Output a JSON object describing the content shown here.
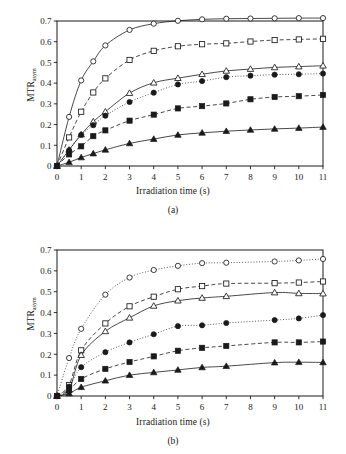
{
  "figure": {
    "background": "#ffffff",
    "ink": "#1a1a1a"
  },
  "panels": [
    {
      "id": "a",
      "caption": "(a)",
      "xlabel": "Irradiation time (s)",
      "ylabel_main": "MTR",
      "ylabel_sub": "asym"
    },
    {
      "id": "b",
      "caption": "(b)",
      "xlabel": "Irradiation time (s)",
      "ylabel_main": "MTR",
      "ylabel_sub": "asym"
    }
  ],
  "chart_data": [
    {
      "type": "scatter",
      "panel": "(a)",
      "title": "",
      "xlabel": "Irradiation time (s)",
      "ylabel": "MTR_asym",
      "xlim": [
        0,
        11
      ],
      "ylim": [
        0,
        0.7
      ],
      "xticks": [
        0,
        1,
        2,
        3,
        4,
        5,
        6,
        7,
        8,
        9,
        10,
        11
      ],
      "xticklabels": [
        "0",
        "1",
        "2",
        "3",
        "4",
        "5",
        "6",
        "7",
        "8",
        "9",
        "10",
        "11"
      ],
      "yticks": [
        0,
        0.1,
        0.2,
        0.3,
        0.4,
        0.5,
        0.6,
        0.7
      ],
      "yticklabels": [
        "0",
        "0.1",
        "0.2",
        "0.3",
        "0.4",
        "0.5",
        "0.6",
        "0.7"
      ],
      "grid": false,
      "legend": "none",
      "x": [
        0,
        0.5,
        1,
        1.5,
        2,
        3,
        4,
        5,
        6,
        7,
        8,
        9,
        10,
        11
      ],
      "series": [
        {
          "name": "open-circle",
          "marker": "circle-open",
          "line": "solid",
          "values": [
            0.0,
            0.237,
            0.413,
            0.505,
            0.582,
            0.657,
            0.687,
            0.701,
            0.708,
            0.711,
            0.712,
            0.713,
            0.714,
            0.714
          ]
        },
        {
          "name": "open-square",
          "marker": "square-open",
          "line": "dashed",
          "values": [
            0.0,
            0.138,
            0.262,
            0.355,
            0.423,
            0.512,
            0.556,
            0.578,
            0.588,
            0.592,
            0.601,
            0.608,
            0.611,
            0.614
          ]
        },
        {
          "name": "open-triangle",
          "marker": "triangle-open",
          "line": "solid",
          "values": [
            0.0,
            0.078,
            0.152,
            0.214,
            0.262,
            0.352,
            0.402,
            0.424,
            0.443,
            0.459,
            0.468,
            0.476,
            0.48,
            0.484
          ]
        },
        {
          "name": "filled-circle",
          "marker": "circle-filled",
          "line": "dotted",
          "values": [
            0.0,
            0.076,
            0.15,
            0.197,
            0.243,
            0.309,
            0.354,
            0.394,
            0.41,
            0.429,
            0.436,
            0.441,
            0.443,
            0.446
          ]
        },
        {
          "name": "filled-square",
          "marker": "square-filled",
          "line": "dashed",
          "values": [
            0.0,
            0.056,
            0.095,
            0.144,
            0.172,
            0.219,
            0.248,
            0.278,
            0.289,
            0.302,
            0.322,
            0.333,
            0.337,
            0.343
          ]
        },
        {
          "name": "filled-triangle",
          "marker": "triangle-filled",
          "line": "solid",
          "values": [
            0.0,
            0.018,
            0.041,
            0.06,
            0.078,
            0.109,
            0.13,
            0.15,
            0.16,
            0.168,
            0.174,
            0.179,
            0.183,
            0.188
          ]
        }
      ]
    },
    {
      "type": "scatter",
      "panel": "(b)",
      "title": "",
      "xlabel": "Irradiation time (s)",
      "ylabel": "MTR_asym",
      "xlim": [
        0,
        11
      ],
      "ylim": [
        0,
        0.7
      ],
      "xticks": [
        0,
        1,
        2,
        3,
        4,
        5,
        6,
        7,
        8,
        9,
        10,
        11
      ],
      "xticklabels": [
        "0",
        "1",
        "2",
        "3",
        "4",
        "5",
        "6",
        "7",
        "8",
        "9",
        "10",
        "11"
      ],
      "yticks": [
        0,
        0.1,
        0.2,
        0.3,
        0.4,
        0.5,
        0.6,
        0.7
      ],
      "yticklabels": [
        "0",
        "0.1",
        "0.2",
        "0.3",
        "0.4",
        "0.5",
        "0.6",
        "0.7"
      ],
      "grid": false,
      "legend": "none",
      "x": [
        0,
        0.5,
        1,
        2,
        3,
        4,
        5,
        6,
        7,
        9,
        10,
        11
      ],
      "series": [
        {
          "name": "open-circle",
          "marker": "circle-open",
          "line": "dotted",
          "values": [
            0.0,
            0.182,
            0.322,
            0.486,
            0.568,
            0.604,
            0.624,
            0.637,
            0.639,
            0.645,
            0.65,
            0.657
          ]
        },
        {
          "name": "open-square",
          "marker": "square-open",
          "line": "dashed",
          "values": [
            0.0,
            0.052,
            0.219,
            0.348,
            0.43,
            0.476,
            0.512,
            0.527,
            0.539,
            0.541,
            0.544,
            0.549
          ]
        },
        {
          "name": "open-triangle",
          "marker": "triangle-open",
          "line": "solid",
          "values": [
            0.0,
            0.03,
            0.196,
            0.31,
            0.375,
            0.432,
            0.457,
            0.47,
            0.478,
            0.496,
            0.492,
            0.491
          ]
        },
        {
          "name": "filled-circle",
          "marker": "circle-filled",
          "line": "dotted",
          "values": [
            0.0,
            0.045,
            0.138,
            0.21,
            0.257,
            0.296,
            0.335,
            0.339,
            0.35,
            0.364,
            0.372,
            0.388
          ]
        },
        {
          "name": "filled-square",
          "marker": "square-filled",
          "line": "dashed",
          "values": [
            0.0,
            0.028,
            0.082,
            0.13,
            0.163,
            0.19,
            0.217,
            0.231,
            0.24,
            0.257,
            0.257,
            0.261
          ]
        },
        {
          "name": "filled-triangle",
          "marker": "triangle-filled",
          "line": "solid",
          "values": [
            0.0,
            0.012,
            0.042,
            0.073,
            0.1,
            0.113,
            0.125,
            0.137,
            0.143,
            0.16,
            0.162,
            0.161
          ]
        }
      ]
    }
  ]
}
